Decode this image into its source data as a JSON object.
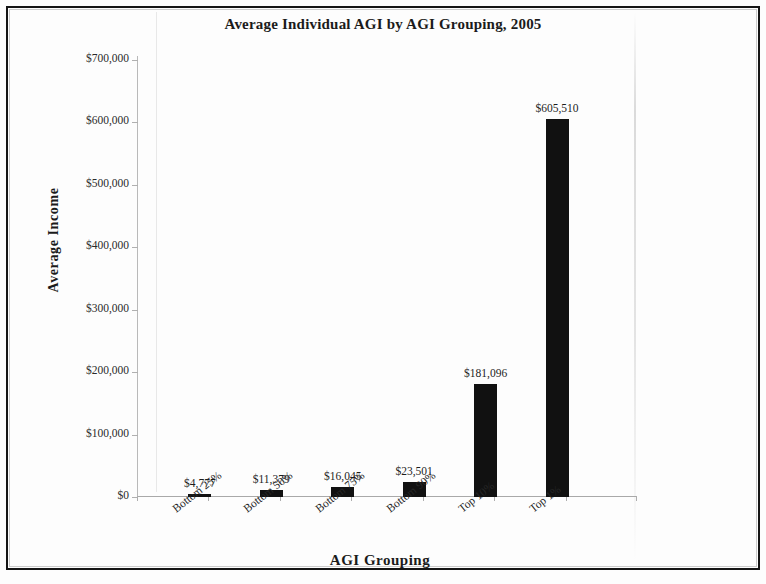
{
  "chart_data": {
    "type": "bar",
    "title": "Average Individual AGI by AGI Grouping, 2005",
    "xlabel": "AGI Grouping",
    "ylabel": "Average Income",
    "categories": [
      "Bottom 25%",
      "Bottom 50%",
      "Bottom 75%",
      "Bottom 90%",
      "Top 10%",
      "Top 1%"
    ],
    "values": [
      4777,
      11379,
      16045,
      23501,
      181096,
      605510
    ],
    "value_labels": [
      "$4,777",
      "$11,379",
      "$16,045",
      "$23,501",
      "$181,096",
      "$605,510"
    ],
    "ylim": [
      0,
      700000
    ],
    "ytick_values": [
      0,
      100000,
      200000,
      300000,
      400000,
      500000,
      600000,
      700000
    ],
    "ytick_labels": [
      "$0",
      "$100,000",
      "$200,000",
      "$300,000",
      "$400,000",
      "$500,000",
      "$600,000",
      "$700,000"
    ],
    "grid": false,
    "legend": "none",
    "bar_color": "#111111",
    "series": [
      {
        "name": "Average Income",
        "values": [
          4777,
          11379,
          16045,
          23501,
          181096,
          605510
        ]
      }
    ]
  }
}
